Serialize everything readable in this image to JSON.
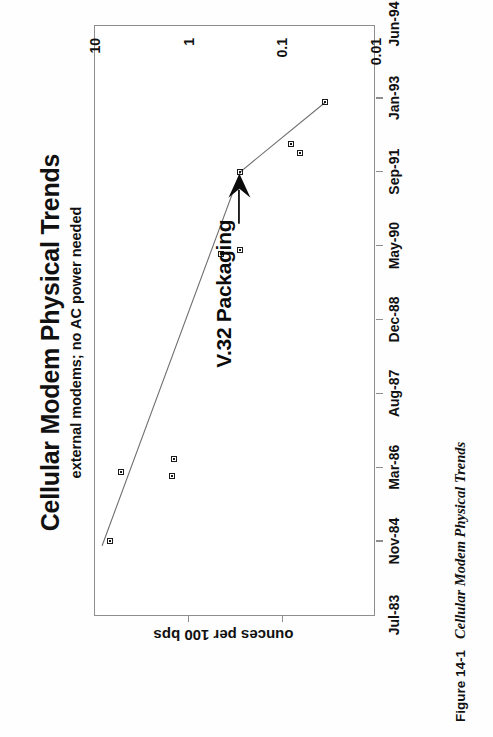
{
  "figure": {
    "caption_number": "Figure 14-1",
    "caption_text": "Cellular Modem Physical Trends"
  },
  "chart_data": {
    "type": "scatter",
    "title": "Cellular Modem Physical Trends",
    "subtitle": "external modems; no AC power needed",
    "xlabel": "",
    "ylabel": "ounces per 100 bps",
    "yscale": "log",
    "ylim": [
      0.01,
      10
    ],
    "ytick_labels": [
      "10",
      "1",
      "0.1",
      "0.01"
    ],
    "ytick_values": [
      10,
      1,
      0.1,
      0.01
    ],
    "xtick_labels": [
      "Jul-83",
      "Nov-84",
      "Mar-86",
      "Aug-87",
      "Dec-88",
      "May-90",
      "Sep-91",
      "Jan-93",
      "Jun-94"
    ],
    "grid": false,
    "legend": "none",
    "orientation": "rotated-90-ccw",
    "points": [
      {
        "x": "Nov-84",
        "y": 7.0
      },
      {
        "x": "Feb-86",
        "y": 5.3
      },
      {
        "x": "Jan-86",
        "y": 1.5
      },
      {
        "x": "May-86",
        "y": 1.45
      },
      {
        "x": "Mar-90",
        "y": 0.45
      },
      {
        "x": "Apr-90",
        "y": 0.28
      },
      {
        "x": "Sep-91",
        "y": 0.28
      },
      {
        "x": "Mar-92",
        "y": 0.08
      },
      {
        "x": "Jan-92",
        "y": 0.065
      },
      {
        "x": "Dec-92",
        "y": 0.035
      }
    ],
    "trend_line": [
      {
        "x": "Oct-84",
        "y": 8.4
      },
      {
        "x": "Sep-91",
        "y": 0.28
      },
      {
        "x": "Dec-92",
        "y": 0.035
      }
    ],
    "annotations": [
      {
        "text": "V.32 Packaging",
        "points_to": {
          "x": "Sep-91",
          "y": 0.28
        }
      }
    ]
  }
}
